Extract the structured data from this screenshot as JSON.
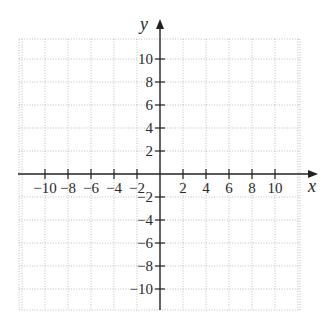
{
  "chart_data": {
    "type": "scatter",
    "title": "",
    "xlabel": "x",
    "ylabel": "y",
    "xlim": [
      -12,
      12
    ],
    "ylim": [
      -12,
      12
    ],
    "grid": true,
    "grid_step": 2,
    "grid_style": "dotted",
    "x_ticks": [
      -10,
      -8,
      -6,
      -4,
      -2,
      2,
      4,
      6,
      8,
      10
    ],
    "y_ticks": [
      10,
      8,
      6,
      4,
      2,
      -2,
      -4,
      -6,
      -8,
      -10
    ],
    "x_tick_labels": [
      "−10",
      "−8",
      "−6",
      "−4",
      "−2",
      "2",
      "4",
      "6",
      "8",
      "10"
    ],
    "y_tick_labels": [
      "10",
      "8",
      "6",
      "4",
      "2",
      "−2",
      "−4",
      "−6",
      "−8",
      "−10"
    ],
    "series": [],
    "legend": null
  },
  "axes": {
    "x_label": "x",
    "y_label": "y"
  },
  "colors": {
    "axis": "#222222",
    "grid": "#b8b8b8",
    "text": "#2a2a2a",
    "background": "#ffffff"
  }
}
